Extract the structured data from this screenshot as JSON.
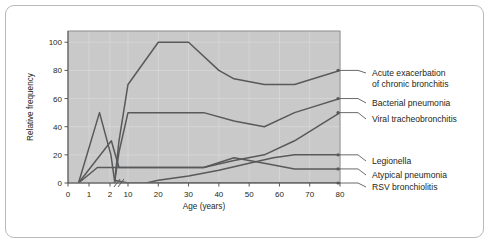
{
  "chart_data": {
    "type": "line",
    "title": "",
    "xlabel": "Age (years)",
    "ylabel": "Relative frequency",
    "xlim": [
      0,
      80
    ],
    "ylim": [
      0,
      108
    ],
    "grid": true,
    "axis_break": {
      "after": 2,
      "before": 10,
      "symbol": "//"
    },
    "xticks": [
      0,
      1,
      2,
      10,
      20,
      30,
      40,
      50,
      60,
      70,
      80
    ],
    "xtick_labels": [
      "0",
      "1",
      "2",
      "10",
      "20",
      "30",
      "40",
      "50",
      "60",
      "70",
      "80"
    ],
    "yticks": [
      0,
      20,
      40,
      60,
      80,
      100
    ],
    "ytick_labels": [
      "0",
      "20",
      "40",
      "60",
      "80",
      "100"
    ],
    "legend_position": "right",
    "plot_background": "#c9c9c9",
    "line_color": "#58595b",
    "series": [
      {
        "name": "RSV bronchiolitis",
        "end_value": 0,
        "x": [
          0.5,
          1.5,
          2.4,
          4,
          10,
          80
        ],
        "values": [
          0,
          50,
          20,
          2,
          0,
          0
        ]
      },
      {
        "name": "Viral tracheobronchitis",
        "end_value": 50,
        "x": [
          0.5,
          2.6,
          4,
          6,
          10,
          35,
          45,
          55,
          65,
          80
        ],
        "values": [
          0,
          30,
          22,
          11,
          11,
          11,
          16,
          20,
          30,
          50
        ]
      },
      {
        "name": "Atypical pneumonia",
        "end_value": 10,
        "x": [
          0.5,
          1.4,
          2,
          6,
          35,
          45,
          55,
          65,
          80
        ],
        "values": [
          0,
          11,
          11,
          11,
          11,
          18,
          14,
          10,
          10
        ]
      },
      {
        "name": "Acute exacerbation of chronic bronchitis",
        "end_value": 80,
        "x": [
          4,
          6,
          10,
          20,
          30,
          40,
          45,
          55,
          65,
          80
        ],
        "values": [
          0,
          30,
          70,
          100,
          100,
          80,
          74,
          70,
          70,
          80
        ]
      },
      {
        "name": "Bacterial pneumonia",
        "end_value": 60,
        "x": [
          4,
          6,
          10,
          20,
          35,
          45,
          55,
          65,
          80
        ],
        "values": [
          0,
          22,
          50,
          50,
          50,
          44,
          40,
          50,
          60
        ]
      },
      {
        "name": "Legionella",
        "end_value": 20,
        "x": [
          16,
          20,
          30,
          40,
          50,
          58,
          65,
          80
        ],
        "values": [
          0,
          2,
          5,
          9,
          14,
          18,
          20,
          20
        ]
      }
    ],
    "legend_entries": [
      {
        "label_line1": "Acute exacerbation",
        "label_line2": "of chronic bronchitis",
        "value": 80
      },
      {
        "label_line1": "Bacterial pneumonia",
        "label_line2": "",
        "value": 60
      },
      {
        "label_line1": "Viral tracheobronchitis",
        "label_line2": "",
        "value": 50
      },
      {
        "label_line1": "Legionella",
        "label_line2": "",
        "value": 20
      },
      {
        "label_line1": "Atypical pneumonia",
        "label_line2": "",
        "value": 10
      },
      {
        "label_line1": "RSV bronchiolitis",
        "label_line2": "",
        "value": 0
      }
    ]
  }
}
